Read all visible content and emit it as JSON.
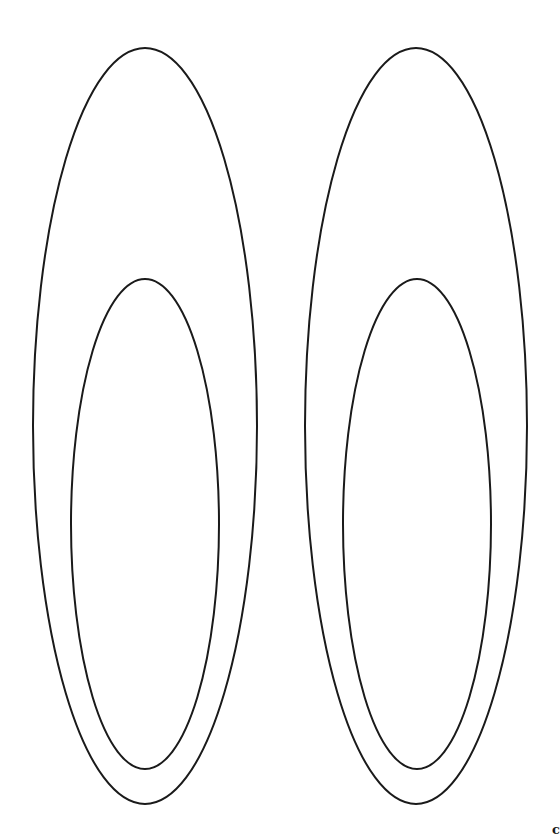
{
  "figure": {
    "stroke_color": "#1a1a1a",
    "background": "#ffffff",
    "shapes": [
      {
        "name": "left-outer-ellipse",
        "cx": 145,
        "cy": 426,
        "rx": 112,
        "ry": 378
      },
      {
        "name": "left-inner-ellipse",
        "cx": 145,
        "cy": 524,
        "rx": 74,
        "ry": 245
      },
      {
        "name": "right-outer-ellipse",
        "cx": 416,
        "cy": 426,
        "rx": 111,
        "ry": 378
      },
      {
        "name": "right-inner-ellipse",
        "cx": 417,
        "cy": 524,
        "rx": 74,
        "ry": 245
      }
    ]
  },
  "corner_text": "c"
}
